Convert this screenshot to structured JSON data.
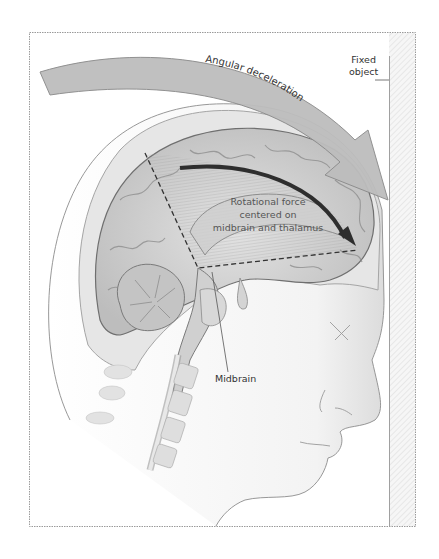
{
  "figure": {
    "type": "anatomical-illustration",
    "labels": {
      "angular_deceleration": "Angular deceleration",
      "fixed_object_line1": "Fixed",
      "fixed_object_line2": "object",
      "rotational_force_line1": "Rotational force",
      "rotational_force_line2": "centered on",
      "rotational_force_line3": "midbrain and thalamus",
      "midbrain": "Midbrain"
    },
    "colors": {
      "frame": "#9a9a9a",
      "arrow_fill": "#b8b8b8",
      "arrow_stroke": "#8a8a8a",
      "brain": "#d6d6d6",
      "brain_dark": "#7a7a7a",
      "skull": "#e4e4e4",
      "inner_arrow": "#3a3a3a",
      "text": "#333333"
    }
  }
}
